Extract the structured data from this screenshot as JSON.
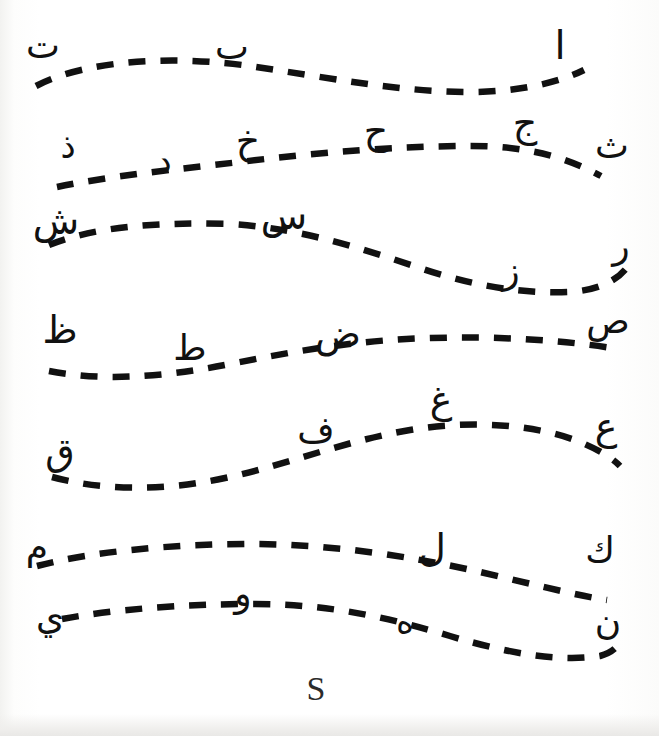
{
  "worksheet": {
    "title": "Arabic Alphabet Tracing Worksheet",
    "background_color": "#ffffff",
    "ink_color": "#111111",
    "dash_color": "#111111",
    "letter_count": 28,
    "line_count": 7
  },
  "rows": [
    {
      "id": "row-1",
      "path": "M 36 86 C 90 58, 180 56, 250 66 C 330 78, 400 92, 470 92 C 520 92, 560 82, 584 70",
      "letters": [
        {
          "char": "ا",
          "name": "letter-alif",
          "x": 560,
          "y": 45,
          "size": 40
        },
        {
          "char": "ب",
          "name": "letter-ba",
          "x": 232,
          "y": 47,
          "size": 36
        },
        {
          "char": "ت",
          "name": "letter-ta",
          "x": 43,
          "y": 46,
          "size": 36
        }
      ]
    },
    {
      "id": "row-2",
      "path": "M 57 187 C 110 176, 170 170, 240 162 C 320 152, 400 146, 470 146 C 520 146, 560 154, 601 176",
      "letters": [
        {
          "char": "ث",
          "name": "letter-tha",
          "x": 612,
          "y": 146,
          "size": 36
        },
        {
          "char": "ج",
          "name": "letter-jeem",
          "x": 525,
          "y": 123,
          "size": 38
        },
        {
          "char": "ح",
          "name": "letter-hha",
          "x": 376,
          "y": 131,
          "size": 38
        },
        {
          "char": "خ",
          "name": "letter-kha",
          "x": 248,
          "y": 141,
          "size": 38
        },
        {
          "char": "د",
          "name": "letter-dal",
          "x": 164,
          "y": 161,
          "size": 34
        },
        {
          "char": "ذ",
          "name": "letter-thal",
          "x": 68,
          "y": 146,
          "size": 34
        }
      ]
    },
    {
      "id": "row-3",
      "path": "M 49 245 C 96 226, 160 222, 230 224 C 300 228, 360 248, 420 268 C 470 285, 520 294, 570 292 C 600 290, 618 280, 628 266",
      "letters": [
        {
          "char": "ر",
          "name": "letter-ra",
          "x": 621,
          "y": 246,
          "size": 36
        },
        {
          "char": "ز",
          "name": "letter-zay",
          "x": 511,
          "y": 271,
          "size": 36
        },
        {
          "char": "س",
          "name": "letter-seen",
          "x": 284,
          "y": 216,
          "size": 38
        },
        {
          "char": "ش",
          "name": "letter-sheen",
          "x": 56,
          "y": 221,
          "size": 38
        }
      ]
    },
    {
      "id": "row-4",
      "path": "M 49 371 C 100 381, 160 378, 230 364 C 300 350, 360 340, 430 338 C 500 336, 560 340, 612 348",
      "letters": [
        {
          "char": "ص",
          "name": "letter-sad",
          "x": 608,
          "y": 321,
          "size": 36
        },
        {
          "char": "ض",
          "name": "letter-dad",
          "x": 338,
          "y": 334,
          "size": 38
        },
        {
          "char": "ط",
          "name": "letter-tta",
          "x": 190,
          "y": 348,
          "size": 36
        },
        {
          "char": "ظ",
          "name": "letter-dha",
          "x": 60,
          "y": 330,
          "size": 38
        }
      ]
    },
    {
      "id": "row-5",
      "path": "M 52 477 C 100 490, 160 492, 225 478 C 290 464, 340 442, 410 430 C 470 420, 530 424, 575 440 C 600 450, 612 458, 620 466",
      "letters": [
        {
          "char": "ع",
          "name": "letter-ayn",
          "x": 606,
          "y": 427,
          "size": 38
        },
        {
          "char": "غ",
          "name": "letter-ghayn",
          "x": 441,
          "y": 400,
          "size": 38
        },
        {
          "char": "ف",
          "name": "letter-fa",
          "x": 316,
          "y": 430,
          "size": 36
        },
        {
          "char": "ق",
          "name": "letter-qaf",
          "x": 60,
          "y": 452,
          "size": 38
        }
      ]
    },
    {
      "id": "row-6",
      "path": "M 37 566 C 90 552, 170 544, 250 544 C 330 544, 410 556, 480 572 C 540 586, 580 596, 607 600",
      "letters": [
        {
          "char": "ك",
          "name": "letter-kaf",
          "x": 600,
          "y": 550,
          "size": 36
        },
        {
          "char": "ل",
          "name": "letter-lam",
          "x": 432,
          "y": 548,
          "size": 38
        },
        {
          "char": "م",
          "name": "letter-meem",
          "x": 37,
          "y": 547,
          "size": 36
        }
      ]
    },
    {
      "id": "row-7",
      "path": "M 62 619 C 110 610, 180 604, 255 604 C 330 604, 390 618, 450 636 C 510 654, 560 662, 600 656 C 615 652, 620 644, 622 636",
      "letters": [
        {
          "char": "ن",
          "name": "letter-noon",
          "x": 608,
          "y": 622,
          "size": 36
        },
        {
          "char": "ه",
          "name": "letter-ha",
          "x": 405,
          "y": 621,
          "size": 34
        },
        {
          "char": "و",
          "name": "letter-waw",
          "x": 243,
          "y": 594,
          "size": 36
        },
        {
          "char": "ي",
          "name": "letter-ya",
          "x": 50,
          "y": 617,
          "size": 36
        }
      ]
    }
  ],
  "annotation": {
    "name": "handwritten-s-mark",
    "char": "S",
    "x": 316,
    "y": 689
  }
}
